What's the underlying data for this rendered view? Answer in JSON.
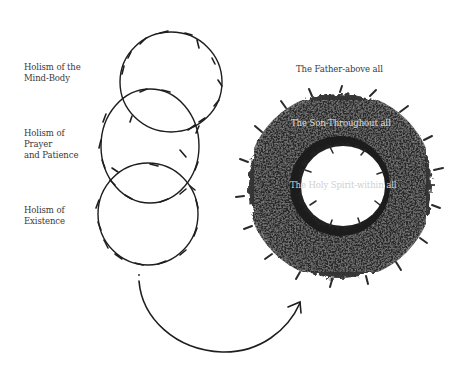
{
  "left_panel": {
    "labels": [
      {
        "text": "Holism of the\nMind-Body"
      },
      {
        "text": "Holism of\nPrayer\nand Patience"
      },
      {
        "text": "Holism of\nExistence"
      }
    ],
    "circles": [
      {
        "name": "top-vine-circle"
      },
      {
        "name": "middle-vine-circle"
      },
      {
        "name": "bottom-vine-circle"
      }
    ]
  },
  "right_panel": {
    "labels": {
      "father": "The Father-above all",
      "son": "The Son-Throughout all",
      "spirit": "The Holy Spirit-within all"
    }
  },
  "colors": {
    "ink": "#1e1e1e",
    "label_text": "#3a3a3a",
    "wreath_dark": "#1b1b1b",
    "wreath_mid": "#3c3c3c",
    "wreath_light_text": "#d8d8d8",
    "background": "#ffffff"
  }
}
